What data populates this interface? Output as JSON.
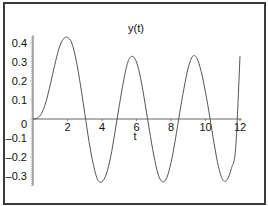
{
  "chart_data": {
    "type": "line",
    "title": "y(t)",
    "xlabel": "t",
    "ylabel": "",
    "xlim": [
      0,
      12
    ],
    "ylim": [
      -0.35,
      0.45
    ],
    "x_ticks": [
      2,
      4,
      6,
      8,
      10,
      12
    ],
    "x_tick_labels": [
      "2",
      "4",
      "6",
      "8",
      "10",
      "12"
    ],
    "y_ticks": [
      0.4,
      0.3,
      0.2,
      0.1,
      0,
      -0.1,
      -0.2,
      -0.3
    ],
    "y_tick_labels": [
      "0.4",
      "0.3",
      "0.2",
      "0.1",
      "0",
      "–0.1",
      "–0.2",
      "–0.3"
    ],
    "grid": false,
    "legend": null,
    "line_color": "#555555",
    "series": [
      {
        "name": "y(t)",
        "x": [
          0,
          0.25,
          0.5,
          0.75,
          1.0,
          1.25,
          1.5,
          1.75,
          2.0,
          2.25,
          2.5,
          2.75,
          3.0,
          3.25,
          3.5,
          3.75,
          4.0,
          4.25,
          4.5,
          4.75,
          5.0,
          5.25,
          5.5,
          5.75,
          6.0,
          6.25,
          6.5,
          6.75,
          7.0,
          7.25,
          7.5,
          7.75,
          8.0,
          8.25,
          8.5,
          8.75,
          9.0,
          9.25,
          9.5,
          9.75,
          10.0,
          10.25,
          10.5,
          10.75,
          11.0,
          11.25,
          11.5,
          11.75,
          12.0
        ],
        "values": [
          0,
          0.005,
          0.03,
          0.09,
          0.18,
          0.28,
          0.37,
          0.42,
          0.43,
          0.4,
          0.31,
          0.18,
          0.03,
          -0.12,
          -0.24,
          -0.32,
          -0.33,
          -0.29,
          -0.2,
          -0.07,
          0.07,
          0.2,
          0.3,
          0.33,
          0.3,
          0.21,
          0.08,
          -0.06,
          -0.19,
          -0.29,
          -0.33,
          -0.31,
          -0.23,
          -0.11,
          0.03,
          0.16,
          0.27,
          0.33,
          0.32,
          0.25,
          0.14,
          0.01,
          -0.13,
          -0.25,
          -0.32,
          -0.32,
          -0.26,
          -0.15,
          0.33
        ]
      }
    ]
  }
}
